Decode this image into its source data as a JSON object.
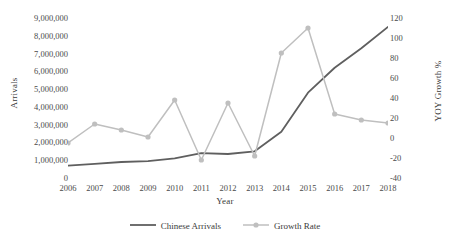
{
  "chart_data": {
    "type": "line",
    "title": "",
    "xlabel": "Year",
    "ylabel": "Arrivals",
    "y2label": "YOY Growth %",
    "categories": [
      "2006",
      "2007",
      "2008",
      "2009",
      "2010",
      "2011",
      "2012",
      "2013",
      "2014",
      "2015",
      "2016",
      "2017",
      "2018"
    ],
    "ylim": [
      0,
      9000000
    ],
    "y2lim": [
      -40,
      120
    ],
    "yticks": [
      "0",
      "1,000,000",
      "2,000,000",
      "3,000,000",
      "4,000,000",
      "5,000,000",
      "6,000,000",
      "7,000,000",
      "8,000,000",
      "9,000,000"
    ],
    "y2ticks": [
      "-40",
      "-20",
      "0",
      "20",
      "40",
      "60",
      "80",
      "100",
      "120"
    ],
    "grid": false,
    "legend_position": "bottom",
    "series": [
      {
        "name": "Chinese Arrivals",
        "axis": "left",
        "color": "#5f5f5f",
        "markers": false,
        "values": [
          700000,
          800000,
          900000,
          950000,
          1100000,
          1400000,
          1350000,
          1500000,
          2600000,
          4800000,
          6200000,
          7300000,
          8500000
        ]
      },
      {
        "name": "Growth Rate",
        "axis": "right",
        "color": "#bfbfbf",
        "markers": true,
        "values": [
          -5,
          14,
          8,
          1,
          38,
          -22,
          35,
          -18,
          85,
          110,
          24,
          18,
          15
        ]
      }
    ]
  },
  "legend": {
    "items": [
      {
        "label": "Chinese Arrivals",
        "color": "#5f5f5f",
        "marker": false
      },
      {
        "label": "Growth Rate",
        "color": "#bfbfbf",
        "marker": true
      }
    ]
  }
}
